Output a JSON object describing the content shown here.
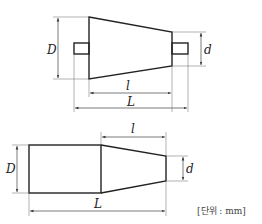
{
  "figures": [
    {
      "name": "frustum-with-shafts",
      "labels": {
        "D": "D",
        "d": "d",
        "l": "l",
        "L": "L"
      }
    },
    {
      "name": "cylinder-with-taper",
      "labels": {
        "D": "D",
        "d": "d",
        "l": "l",
        "L": "L"
      }
    }
  ],
  "unit_note": "[단위 : mm]",
  "colors": {
    "line": "#222222",
    "dimension": "#444444",
    "background": "#ffffff"
  }
}
